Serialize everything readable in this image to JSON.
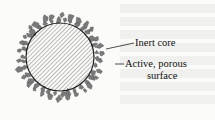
{
  "diagram": {
    "labels": {
      "core": "Inert core",
      "surface_line1": "Active, porous",
      "surface_line2": "surface"
    },
    "colors": {
      "background": "#fbfbf9",
      "particles": "#7a7a7a",
      "outline": "#222222",
      "hatch": "#666666"
    }
  }
}
